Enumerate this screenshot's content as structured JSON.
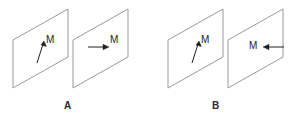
{
  "figure": {
    "title": "",
    "panels": [
      {
        "id": "A",
        "label": "A",
        "planes": [
          {
            "name": "plane-a-1",
            "corners": [
              [
                13,
                40
              ],
              [
                68,
                9
              ],
              [
                68,
                57
              ],
              [
                13,
                88
              ]
            ],
            "vector": {
              "label": "M",
              "direction": "up-right-steep",
              "tail": [
                37,
                63
              ],
              "head": [
                44,
                41
              ]
            }
          },
          {
            "name": "plane-a-2",
            "corners": [
              [
                73,
                40
              ],
              [
                128,
                9
              ],
              [
                128,
                57
              ],
              [
                73,
                88
              ]
            ],
            "vector": {
              "label": "M",
              "direction": "right-horizontal",
              "tail": [
                88,
                47
              ],
              "head": [
                109,
                47
              ]
            }
          }
        ]
      },
      {
        "id": "B",
        "label": "B",
        "planes": [
          {
            "name": "plane-b-1",
            "corners": [
              [
                168,
                40
              ],
              [
                223,
                9
              ],
              [
                223,
                57
              ],
              [
                168,
                88
              ]
            ],
            "vector": {
              "label": "M",
              "direction": "up-right-steep",
              "tail": [
                192,
                63
              ],
              "head": [
                199,
                41
              ]
            }
          },
          {
            "name": "plane-b-2",
            "corners": [
              [
                228,
                40
              ],
              [
                283,
                9
              ],
              [
                283,
                57
              ],
              [
                228,
                88
              ]
            ],
            "vector": {
              "label": "M",
              "direction": "left-horizontal",
              "tail": [
                284,
                47
              ],
              "head": [
                263,
                47
              ]
            }
          }
        ]
      }
    ],
    "colors": {
      "background": "#ffffff",
      "plane_stroke": "#9a9a9a",
      "arrow_stroke": "#1f1f1f",
      "label_text": "#2b2b2b",
      "m_text": "#1f1f1f"
    },
    "m_labels": {
      "a1": "M",
      "a2": "M",
      "b1": "M",
      "b2": "M"
    }
  }
}
